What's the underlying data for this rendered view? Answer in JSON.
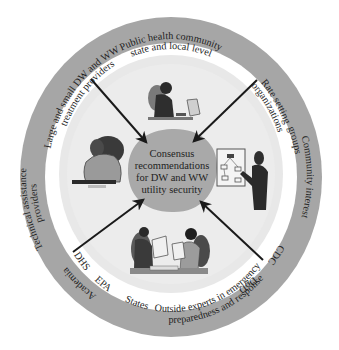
{
  "diagram": {
    "title": "Consensus recommendations for DW and WW utility security",
    "center": {
      "lines": [
        "Consensus",
        "recommendations",
        "for DW and WW",
        "utility security"
      ]
    },
    "ring_labels": {
      "public_health": [
        "Public health community",
        "state and local level"
      ],
      "rate_setting": [
        "Rate setting",
        "organizations"
      ],
      "community_interest": [
        "Community interest",
        "groups"
      ],
      "cdc": "CDC",
      "dod": "DoD",
      "outside_experts": [
        "Outside experts in emergency",
        "preparedness and response"
      ],
      "states": "States",
      "epa": "EPA",
      "dhs": "DHS",
      "academia": "Academia",
      "technical_assistance": [
        "Technical assistance",
        "providers"
      ],
      "treatment_providers": [
        "Large and small DW and WW",
        "treatment providers"
      ]
    },
    "illustrations": [
      {
        "id": "person-at-computer",
        "position": "top"
      },
      {
        "id": "person-on-phone",
        "position": "left"
      },
      {
        "id": "presenter-with-flowchart",
        "position": "right"
      },
      {
        "id": "two-people-reviewing-documents",
        "position": "bottom"
      }
    ],
    "arrows": [
      {
        "from": "upper-left",
        "to": "center"
      },
      {
        "from": "upper-right",
        "to": "center"
      },
      {
        "from": "lower-left",
        "to": "center"
      },
      {
        "from": "lower-right",
        "to": "center"
      }
    ],
    "colors": {
      "ring": "#a6a6a6",
      "gap": "#ffffff",
      "inner_disc": "#e6e6e6",
      "center_blob": "#a9a9a9",
      "arrow": "#1a1a1a",
      "text": "#1e1e1e"
    }
  }
}
